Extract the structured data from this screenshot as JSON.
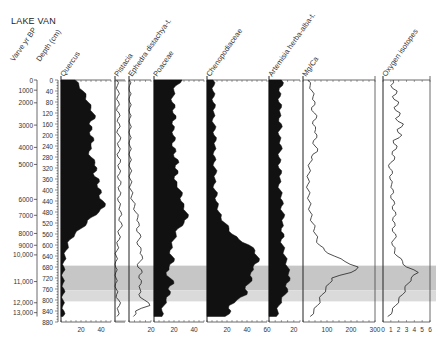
{
  "title": "LAKE VAN",
  "chart_data": {
    "type": "area",
    "title": "LAKE VAN",
    "y_axes": [
      {
        "name": "Varve yr BP",
        "ticks": [
          "0",
          "1000",
          "2000",
          "3000",
          "4000",
          "5000",
          "6000",
          "7000",
          "8000",
          "9000",
          "10,000",
          "11,000",
          "12,000",
          "13,000"
        ],
        "tick_depths": [
          0,
          37,
          83,
          164,
          245,
          307,
          434,
          492,
          558,
          601,
          636,
          733,
          810,
          846
        ]
      },
      {
        "name": "Depth (cm)",
        "ticks": [
          "0",
          "40",
          "80",
          "120",
          "160",
          "200",
          "240",
          "280",
          "320",
          "360",
          "400",
          "440",
          "480",
          "520",
          "560",
          "600",
          "640",
          "680",
          "720",
          "760",
          "800",
          "840",
          "880"
        ],
        "range": [
          0,
          880
        ]
      }
    ],
    "shaded_intervals": [
      {
        "from_depth": 675,
        "to_depth": 765,
        "shade": "#c6c6c6"
      },
      {
        "from_depth": 765,
        "to_depth": 805,
        "shade": "#dadada"
      }
    ],
    "depth": [
      0,
      20,
      40,
      60,
      80,
      100,
      120,
      140,
      160,
      180,
      200,
      220,
      240,
      260,
      280,
      300,
      320,
      340,
      360,
      380,
      400,
      420,
      440,
      460,
      480,
      500,
      520,
      540,
      560,
      580,
      600,
      620,
      640,
      660,
      680,
      700,
      720,
      740,
      760,
      780,
      800,
      820,
      840,
      860
    ],
    "series": [
      {
        "name": "Quercus",
        "unit": "%",
        "xlim": [
          0,
          50
        ],
        "ticks": [
          "20",
          "40"
        ],
        "style": "filled",
        "values": [
          14,
          18,
          22,
          25,
          27,
          30,
          32,
          34,
          28,
          31,
          29,
          33,
          30,
          28,
          30,
          34,
          36,
          32,
          38,
          36,
          40,
          38,
          42,
          44,
          38,
          30,
          26,
          20,
          14,
          9,
          7,
          5,
          4,
          3,
          3,
          2,
          2,
          2,
          3,
          2,
          2,
          2,
          3,
          2
        ]
      },
      {
        "name": "Pistacia",
        "unit": "%",
        "xlim": [
          0,
          5
        ],
        "ticks": [],
        "style": "line",
        "values": [
          0.8,
          1.2,
          1.6,
          1.3,
          1.8,
          1.1,
          2.0,
          1.5,
          2.2,
          1.4,
          1.9,
          2.4,
          1.6,
          2.1,
          1.5,
          2.6,
          1.8,
          2.3,
          1.7,
          2.8,
          1.9,
          2.5,
          1.6,
          2.4,
          3.0,
          2.2,
          3.2,
          2.6,
          1.8,
          2.1,
          1.2,
          1.0,
          0.6,
          0.4,
          0.3,
          0.4,
          0.5,
          0.3,
          0.6,
          0.8,
          1.8,
          2.2,
          1.6,
          1.0
        ]
      },
      {
        "name": "Ephedra distachya-t.",
        "unit": "%",
        "xlim": [
          0,
          20
        ],
        "ticks": [
          "20"
        ],
        "style": "line",
        "values": [
          0.3,
          0.5,
          0.4,
          0.6,
          0.5,
          0.7,
          0.5,
          0.6,
          0.8,
          0.6,
          0.7,
          0.5,
          0.8,
          0.7,
          0.9,
          0.8,
          1.0,
          1.2,
          1.0,
          1.5,
          1.8,
          2.5,
          3.5,
          5,
          6,
          8,
          9,
          7,
          10,
          9,
          8,
          11,
          12,
          10,
          8,
          12,
          9,
          11,
          10,
          9,
          14,
          19,
          6,
          4
        ]
      },
      {
        "name": "Poaceae",
        "unit": "%",
        "xlim": [
          0,
          50
        ],
        "ticks": [
          "20",
          "40"
        ],
        "style": "filled",
        "values": [
          28,
          22,
          20,
          19,
          18,
          21,
          19,
          22,
          18,
          20,
          19,
          21,
          18,
          22,
          20,
          25,
          21,
          24,
          20,
          23,
          26,
          28,
          27,
          30,
          32,
          34,
          30,
          24,
          22,
          20,
          18,
          16,
          18,
          20,
          15,
          12,
          16,
          20,
          14,
          16,
          12,
          10,
          8,
          8
        ]
      },
      {
        "name": "Chenopodiaceae",
        "unit": "%",
        "xlim": [
          0,
          60
        ],
        "ticks": [
          "20",
          "40",
          "60"
        ],
        "style": "filled",
        "values": [
          6,
          7,
          6,
          7,
          6,
          8,
          7,
          6,
          7,
          8,
          7,
          9,
          8,
          7,
          8,
          7,
          8,
          9,
          8,
          7,
          8,
          10,
          9,
          11,
          12,
          14,
          18,
          22,
          25,
          32,
          42,
          48,
          50,
          52,
          46,
          44,
          45,
          42,
          38,
          40,
          30,
          22,
          24,
          18
        ]
      },
      {
        "name": "Artemisia herba-alba-t.",
        "unit": "%",
        "xlim": [
          0,
          25
        ],
        "ticks": [
          "20"
        ],
        "style": "filled",
        "values": [
          10,
          11,
          8,
          9,
          8,
          10,
          9,
          8,
          10,
          9,
          8,
          9,
          10,
          9,
          8,
          9,
          8,
          10,
          9,
          8,
          9,
          10,
          11,
          10,
          11,
          12,
          11,
          10,
          12,
          10,
          11,
          12,
          13,
          14,
          15,
          16,
          17,
          14,
          15,
          13,
          10,
          8,
          7,
          6
        ]
      },
      {
        "name": "Mg/Ca",
        "unit": "",
        "xlim": [
          0,
          300
        ],
        "ticks": [
          "100",
          "200",
          "300"
        ],
        "style": "line",
        "values": [
          20,
          30,
          38,
          42,
          50,
          36,
          48,
          55,
          40,
          52,
          58,
          44,
          50,
          60,
          35,
          30,
          26,
          24,
          22,
          20,
          22,
          24,
          26,
          28,
          30,
          34,
          40,
          48,
          52,
          58,
          68,
          90,
          130,
          175,
          230,
          200,
          120,
          110,
          95,
          80,
          70,
          60,
          45,
          30
        ]
      },
      {
        "name": "Oxygen isotopes",
        "unit": "",
        "xlim": [
          0,
          6
        ],
        "ticks": [
          "0",
          "1",
          "2",
          "3",
          "4",
          "5",
          "6"
        ],
        "style": "line",
        "values": [
          1.3,
          1.0,
          1.8,
          1.2,
          2.0,
          1.4,
          2.2,
          1.6,
          2.6,
          1.8,
          2.4,
          1.3,
          1.8,
          1.2,
          1.5,
          1.0,
          0.8,
          1.2,
          0.9,
          1.1,
          1.3,
          1.0,
          1.4,
          1.2,
          1.6,
          1.3,
          1.5,
          1.2,
          1.6,
          1.4,
          1.2,
          1.5,
          1.8,
          2.5,
          3.0,
          4.5,
          3.6,
          3.2,
          2.8,
          2.5,
          2.0,
          1.6,
          1.2,
          0.6
        ]
      }
    ]
  }
}
